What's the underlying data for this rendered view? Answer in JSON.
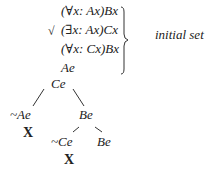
{
  "initial_set": {
    "label": "initial set",
    "formulas": [
      "(∀x: Ax)Bx",
      "(∃x: Ax)Cx",
      "(∀x: Cx)Bx",
      "Ae"
    ],
    "checked_index": 1,
    "check_mark": "√"
  },
  "tree": {
    "root": "Ce",
    "left_branch": {
      "node": "~Ae",
      "closed": "X"
    },
    "right_branch": {
      "node": "Be",
      "children": [
        {
          "node": "~Ce",
          "closed": "X"
        },
        {
          "node": "Be"
        }
      ]
    }
  }
}
